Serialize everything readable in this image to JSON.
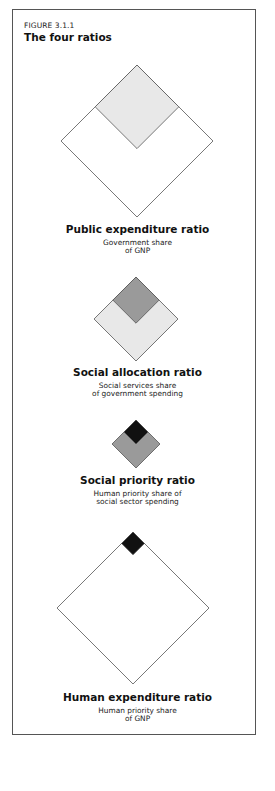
{
  "figure": {
    "label": "FIGURE 3.1.1",
    "title": "The four ratios"
  },
  "colors": {
    "outline": "#555555",
    "white": "#ffffff",
    "light_gray": "#e8e8e8",
    "mid_gray": "#9a9a9a",
    "black": "#111111"
  },
  "ratios": [
    {
      "name": "Public expenditure ratio",
      "description_lines": [
        "Government share",
        "of GNP"
      ],
      "outer_fill": "white",
      "inner_fill": "light_gray",
      "inner_share_of_outer_side": 0.55
    },
    {
      "name": "Social allocation ratio",
      "description_lines": [
        "Social services share",
        "of government spending"
      ],
      "outer_fill": "light_gray",
      "inner_fill": "mid_gray",
      "inner_share_of_outer_side": 0.55
    },
    {
      "name": "Social priority ratio",
      "description_lines": [
        "Human priority share of",
        "social sector spending"
      ],
      "outer_fill": "mid_gray",
      "inner_fill": "black",
      "inner_share_of_outer_side": 0.5
    },
    {
      "name": "Human expenditure ratio",
      "description_lines": [
        "Human priority share",
        "of GNP"
      ],
      "outer_fill": "white",
      "inner_fill": "black",
      "inner_share_of_outer_side": 0.15
    }
  ]
}
